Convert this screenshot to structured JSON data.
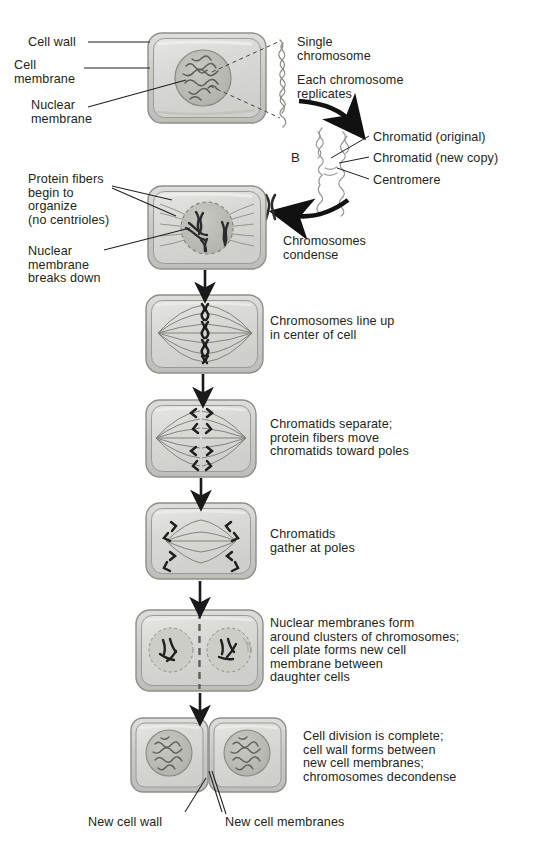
{
  "figure": {
    "panel_letter": "B"
  },
  "colors": {
    "background": "#ffffff",
    "text": "#231f20",
    "cell_fill": "#d5d5d2",
    "cell_fill_light": "#e2e2df",
    "cell_border": "#8e8e8a",
    "nucleus_fill": "#bcbcb7",
    "nucleus_border": "#8a8a85",
    "chromatin": "#6e6e69",
    "chromosome": "#2b2b2b",
    "fiber": "#6a6a66",
    "leader_line": "#231f20",
    "arrow": "#1a1a1a"
  },
  "left_labels": [
    {
      "id": "cell-wall",
      "text": "Cell wall",
      "x": 28,
      "y": 36
    },
    {
      "id": "cell-membrane",
      "text": "Cell\nmembrane",
      "x": 14,
      "y": 59
    },
    {
      "id": "nuclear-membrane",
      "text": "Nuclear\nmembrane",
      "x": 31,
      "y": 99
    },
    {
      "id": "protein-fibers",
      "text": "Protein fibers\nbegin to\norganize\n(no centrioles)",
      "x": 28,
      "y": 173
    },
    {
      "id": "nuclear-membrane-breaks",
      "text": "Nuclear\nmembrane\nbreaks down",
      "x": 28,
      "y": 245
    },
    {
      "id": "new-cell-wall",
      "text": "New cell wall",
      "x": 88,
      "y": 816
    },
    {
      "id": "new-cell-membranes",
      "text": "New cell membranes",
      "x": 225,
      "y": 816
    }
  ],
  "right_labels": [
    {
      "id": "single-chromosome",
      "text": "Single\nchromosome",
      "x": 297,
      "y": 36
    },
    {
      "id": "each-chromosome-replicates",
      "text": "Each chromosome\nreplicates",
      "x": 297,
      "y": 74
    },
    {
      "id": "chromatid-original",
      "text": "Chromatid (original)",
      "x": 373,
      "y": 131
    },
    {
      "id": "chromatid-new-copy",
      "text": "Chromatid (new copy)",
      "x": 373,
      "y": 152
    },
    {
      "id": "centromere",
      "text": "Centromere",
      "x": 373,
      "y": 174
    },
    {
      "id": "chromosomes-condense",
      "text": "Chromosomes\ncondense",
      "x": 283,
      "y": 235
    },
    {
      "id": "chromosomes-line-up",
      "text": "Chromosomes line up\nin center of cell",
      "x": 270,
      "y": 315
    },
    {
      "id": "chromatids-separate",
      "text": "Chromatids separate;\nprotein fibers move\nchromatids toward poles",
      "x": 270,
      "y": 418
    },
    {
      "id": "chromatids-gather",
      "text": "Chromatids\ngather at poles",
      "x": 270,
      "y": 528
    },
    {
      "id": "nuclear-membranes-form",
      "text": "Nuclear membranes form\naround clusters of chromosomes;\ncell plate forms new cell\nmembrane between\ndaughter cells",
      "x": 270,
      "y": 617
    },
    {
      "id": "cell-division-complete",
      "text": "Cell division is complete;\ncell wall forms between\nnew cell membranes;\nchromosomes decondense",
      "x": 303,
      "y": 730
    }
  ],
  "stages": [
    {
      "id": "interphase",
      "index": 1,
      "x": 148,
      "y": 33,
      "w": 118,
      "h": 90,
      "caption_id": "none"
    },
    {
      "id": "prophase",
      "index": 2,
      "x": 148,
      "y": 186,
      "w": 118,
      "h": 83,
      "caption_id": "chromosomes-condense"
    },
    {
      "id": "metaphase",
      "index": 3,
      "x": 146,
      "y": 295,
      "w": 117,
      "h": 78,
      "caption_id": "chromosomes-line-up"
    },
    {
      "id": "early-anaphase",
      "index": 4,
      "x": 146,
      "y": 400,
      "w": 110,
      "h": 77,
      "caption_id": "chromatids-separate"
    },
    {
      "id": "late-anaphase",
      "index": 5,
      "x": 146,
      "y": 503,
      "w": 110,
      "h": 76,
      "caption_id": "chromatids-gather"
    },
    {
      "id": "telophase",
      "index": 6,
      "x": 136,
      "y": 610,
      "w": 127,
      "h": 81,
      "caption_id": "nuclear-membranes-form"
    },
    {
      "id": "daughter-cells",
      "index": 7,
      "x": 131,
      "y": 718,
      "w": 155,
      "h": 74,
      "caption_id": "cell-division-complete"
    }
  ],
  "flow_arrows": [
    {
      "id": "arrow-prophase-to-metaphase",
      "x": 205,
      "y": 270,
      "length": 24
    },
    {
      "id": "arrow-metaphase-to-anaphase",
      "x": 203,
      "y": 374,
      "length": 24
    },
    {
      "id": "arrow-anaphase-to-late",
      "x": 201,
      "y": 478,
      "length": 23
    },
    {
      "id": "arrow-late-to-telophase",
      "x": 200,
      "y": 580,
      "length": 28
    },
    {
      "id": "arrow-telophase-to-daughter",
      "x": 200,
      "y": 692,
      "length": 24
    }
  ],
  "curved_arrows": [
    {
      "id": "arrow-replication",
      "direction": "down-right"
    },
    {
      "id": "arrow-condense",
      "direction": "down-left"
    }
  ],
  "chromosome_glyphs": [
    {
      "id": "single-chromosome-strand",
      "type": "thin-squiggle",
      "x": 272,
      "y": 40
    },
    {
      "id": "replicated-chromosome-pair",
      "type": "double-squiggle",
      "x": 310,
      "y": 126
    },
    {
      "id": "condensed-chromosome-x",
      "type": "x-shape",
      "x": 266,
      "y": 194
    }
  ]
}
